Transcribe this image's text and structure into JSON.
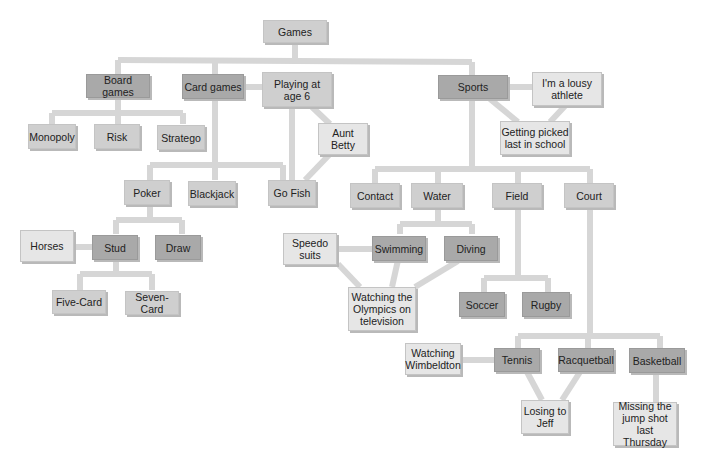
{
  "diagram": {
    "line_color": "#d6d6d6",
    "colors": {
      "dark": "#a9a9a9",
      "mid": "#cfcfcf",
      "light": "#e6e6e6"
    },
    "nodes": {
      "games": "Games",
      "board_games": "Board games",
      "card_games": "Card games",
      "playing_age6": "Playing at\nage 6",
      "sports": "Sports",
      "lousy_athlete": "I'm a lousy\nathlete",
      "picked_last": "Getting picked\nlast in school",
      "monopoly": "Monopoly",
      "risk": "Risk",
      "stratego": "Stratego",
      "aunt_betty": "Aunt\nBetty",
      "poker": "Poker",
      "blackjack": "Blackjack",
      "go_fish": "Go Fish",
      "contact": "Contact",
      "water": "Water",
      "field": "Field",
      "court": "Court",
      "horses": "Horses",
      "stud": "Stud",
      "draw": "Draw",
      "five_card": "Five-Card",
      "seven_card": "Seven-Card",
      "speedo": "Speedo\nsuits",
      "swimming": "Swimming",
      "diving": "Diving",
      "olympics": "Watching the\nOlympics on\ntelevision",
      "soccer": "Soccer",
      "rugby": "Rugby",
      "wimbeldton": "Watching\nWimbeldton",
      "tennis": "Tennis",
      "racquetball": "Racquetball",
      "basketball": "Basketball",
      "losing_jeff": "Losing to\nJeff",
      "jump_shot": "Missing the\njump shot\nlast Thursday"
    }
  }
}
